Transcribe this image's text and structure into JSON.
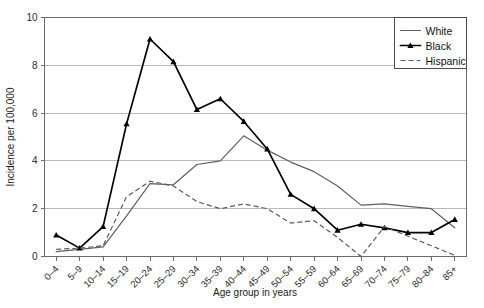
{
  "chart_data": {
    "type": "line",
    "title": "",
    "xlabel": "Age group in years",
    "ylabel": "Incidence per 100,000",
    "categories": [
      "0–4",
      "5–9",
      "10–14",
      "15–19",
      "20–24",
      "25–29",
      "30–34",
      "35–39",
      "40–44",
      "45–49",
      "50–54",
      "55–59",
      "60–64",
      "65–69",
      "70–74",
      "75–79",
      "80–84",
      "85+"
    ],
    "ylim": [
      0,
      10
    ],
    "yticks": [
      0,
      2,
      4,
      6,
      8,
      10
    ],
    "ytick_labels": [
      "0",
      "2",
      "4",
      "6",
      "8",
      "10"
    ],
    "grid": "horizontal",
    "legend_position": "top-right",
    "series": [
      {
        "name": "White",
        "style": "solid",
        "marker": "none",
        "color": "#5f5f5f",
        "values": [
          0.2,
          0.3,
          0.4,
          1.7,
          3.05,
          3.0,
          3.85,
          4.0,
          5.05,
          4.45,
          3.95,
          3.55,
          2.95,
          2.15,
          2.2,
          2.1,
          2.0,
          1.2
        ]
      },
      {
        "name": "Black",
        "style": "solid",
        "marker": "triangle",
        "color": "#000000",
        "values": [
          0.9,
          0.35,
          1.25,
          5.55,
          9.1,
          8.15,
          6.15,
          6.6,
          5.65,
          4.5,
          2.6,
          2.0,
          1.1,
          1.35,
          1.2,
          1.0,
          1.0,
          1.55
        ]
      },
      {
        "name": "Hispanic",
        "style": "dashed",
        "marker": "none",
        "color": "#5a5a5a",
        "values": [
          0.3,
          0.35,
          0.45,
          2.5,
          3.15,
          2.95,
          2.3,
          2.0,
          2.2,
          2.0,
          1.4,
          1.5,
          0.8,
          0.0,
          1.25,
          0.85,
          0.45,
          0.05
        ]
      }
    ]
  },
  "legend": {
    "items": [
      {
        "label": "White"
      },
      {
        "label": "Black"
      },
      {
        "label": "Hispanic"
      }
    ]
  }
}
